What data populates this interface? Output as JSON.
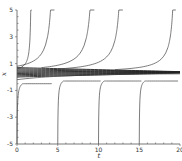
{
  "chart_data": {
    "type": "line",
    "title": "",
    "xlabel": "t",
    "ylabel": "x",
    "xlim": [
      0,
      20
    ],
    "ylim": [
      -5,
      5
    ],
    "x_ticks": [
      0,
      5,
      10,
      15,
      20
    ],
    "x_tick_labels": [
      "0",
      "5",
      "10",
      "15",
      "20"
    ],
    "y_ticks": [
      -5,
      -3,
      -1,
      1,
      3,
      5
    ],
    "y_tick_labels": [
      "-5",
      "-3",
      "-1",
      "1",
      "3",
      "5"
    ],
    "grid": false,
    "legend": null,
    "series": [
      {
        "name": "attracting band",
        "kind": "band",
        "level": 0.35,
        "spread_start": 0.35,
        "spread_end": 0.05,
        "strands": 9
      },
      {
        "name": "blowup-1",
        "kind": "up",
        "start_t": 0,
        "start_x": 0.6,
        "asymptote_t": 1.8
      },
      {
        "name": "blowup-2",
        "kind": "up",
        "start_t": 0,
        "start_x": 0.8,
        "asymptote_t": 4.6
      },
      {
        "name": "blowup-3",
        "kind": "up",
        "start_t": 3,
        "start_x": 0.7,
        "asymptote_t": 9.5
      },
      {
        "name": "blowup-4",
        "kind": "up",
        "start_t": 5,
        "start_x": 0.6,
        "asymptote_t": 13.0
      },
      {
        "name": "blowup-5",
        "kind": "up",
        "start_t": 12,
        "start_x": 0.55,
        "asymptote_t": 19.5
      },
      {
        "name": "from-below-1",
        "kind": "down",
        "origin_t": 0.0,
        "end_t": 4.5,
        "end_x": -0.5
      },
      {
        "name": "from-below-2",
        "kind": "down",
        "origin_t": 5.0,
        "end_t": 10.5,
        "end_x": -0.3
      },
      {
        "name": "from-below-3",
        "kind": "down",
        "origin_t": 10.0,
        "end_t": 15.5,
        "end_x": -0.3
      },
      {
        "name": "from-below-4",
        "kind": "down",
        "origin_t": 15.0,
        "end_t": 20.0,
        "end_x": -0.3
      },
      {
        "name": "lower-approach",
        "kind": "lower",
        "start_t": 0,
        "start_x": -0.2,
        "end_t": 20,
        "end_x": 0.25
      }
    ]
  }
}
